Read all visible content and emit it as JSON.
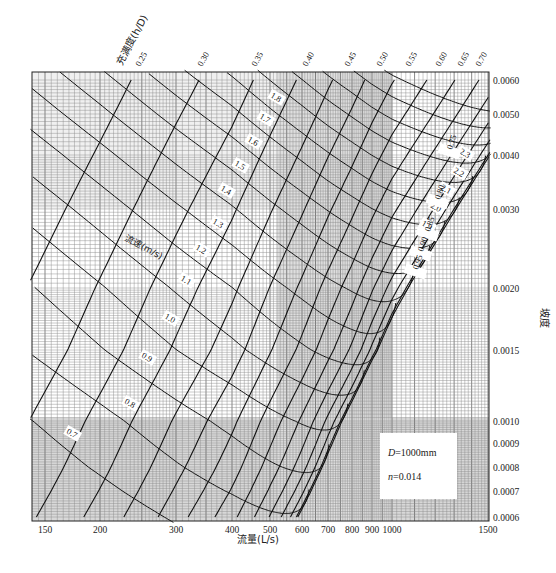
{
  "chart_data": {
    "type": "line",
    "title": "",
    "subtitle": "Circular pipe hydraulic nomograph",
    "xlabel": "流量(L/s)",
    "ylabel": "坡度",
    "x_scale": "log",
    "y_scale": "log",
    "xlim": [
      140,
      1520
    ],
    "ylim": [
      0.0006,
      0.0061
    ],
    "grid": true,
    "x_ticks": [
      {
        "value": 150,
        "label": "150",
        "px": 45
      },
      {
        "value": 200,
        "label": "200",
        "px": 100
      },
      {
        "value": 300,
        "label": "300",
        "px": 176
      },
      {
        "value": 400,
        "label": "400",
        "px": 232
      },
      {
        "value": 500,
        "label": "500",
        "px": 270
      },
      {
        "value": 600,
        "label": "600",
        "px": 302
      },
      {
        "value": 700,
        "label": "700",
        "px": 328
      },
      {
        "value": 800,
        "label": "800",
        "px": 352
      },
      {
        "value": 900,
        "label": "900",
        "px": 372
      },
      {
        "value": 1000,
        "label": "1000",
        "px": 392
      },
      {
        "value": 1500,
        "label": "1500",
        "px": 488
      }
    ],
    "y_ticks": [
      {
        "value": 0.006,
        "label": "0.0060",
        "px": 80
      },
      {
        "value": 0.005,
        "label": "0.0050",
        "px": 114
      },
      {
        "value": 0.004,
        "label": "0.0040",
        "px": 155
      },
      {
        "value": 0.003,
        "label": "0.0030",
        "px": 209
      },
      {
        "value": 0.002,
        "label": "0.0020",
        "px": 288
      },
      {
        "value": 0.0015,
        "label": "0.0015",
        "px": 350
      },
      {
        "value": 0.001,
        "label": "0.0010",
        "px": 421
      },
      {
        "value": 0.0009,
        "label": "0.0009",
        "px": 443
      },
      {
        "value": 0.0008,
        "label": "0.0008",
        "px": 467
      },
      {
        "value": 0.0007,
        "label": "0.0007",
        "px": 491
      },
      {
        "value": 0.0006,
        "label": "0.0006",
        "px": 517
      }
    ],
    "fullness_title": "充满度(h/D)",
    "fullness_series": [
      {
        "name": "0.25",
        "value": 0.25
      },
      {
        "name": "0.30",
        "value": 0.3
      },
      {
        "name": "0.35",
        "value": 0.35
      },
      {
        "name": "0.40",
        "value": 0.4
      },
      {
        "name": "0.45",
        "value": 0.45
      },
      {
        "name": "0.50",
        "value": 0.5
      },
      {
        "name": "0.55",
        "value": 0.55
      },
      {
        "name": "0.60",
        "value": 0.6
      },
      {
        "name": "0.65",
        "value": 0.65
      },
      {
        "name": "0.70",
        "value": 0.7
      },
      {
        "name": "0.75",
        "value": 0.75
      },
      {
        "name": "0.80",
        "value": 0.8
      },
      {
        "name": "0.85",
        "value": 0.85
      },
      {
        "name": "0.90",
        "value": 0.9
      },
      {
        "name": "0.95",
        "value": 0.95
      }
    ],
    "velocity_title": "流速(m/s)",
    "velocity_series": [
      {
        "name": "0.7",
        "value": 0.7
      },
      {
        "name": "0.8",
        "value": 0.8
      },
      {
        "name": "0.9",
        "value": 0.9
      },
      {
        "name": "1.0",
        "value": 1.0
      },
      {
        "name": "1.1",
        "value": 1.1
      },
      {
        "name": "1.2",
        "value": 1.2
      },
      {
        "name": "1.3",
        "value": 1.3
      },
      {
        "name": "1.4",
        "value": 1.4
      },
      {
        "name": "1.5",
        "value": 1.5
      },
      {
        "name": "1.6",
        "value": 1.6
      },
      {
        "name": "1.7",
        "value": 1.7
      },
      {
        "name": "1.8",
        "value": 1.8
      },
      {
        "name": "1.9",
        "value": 1.9
      },
      {
        "name": "2.0",
        "value": 2.0
      },
      {
        "name": "2.1",
        "value": 2.1
      },
      {
        "name": "2.2",
        "value": 2.2
      },
      {
        "name": "2.3",
        "value": 2.3
      }
    ],
    "parameters": {
      "diameter": "D=1000mm",
      "roughness": "n=0.014"
    },
    "annotations": [
      "D=1000mm",
      "n=0.014",
      "流速(m/s)",
      "充满度(h/D)"
    ]
  },
  "labels": {
    "xlabel": "流量(L/s)",
    "ylabel": "坡度",
    "fullness_title": "充满度(h/D)",
    "velocity_title": "流速(m/s)",
    "diameter": "D=1000mm",
    "roughness": "n=0.014"
  }
}
